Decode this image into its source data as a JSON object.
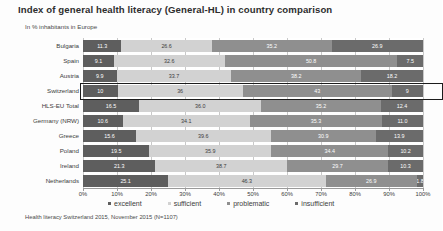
{
  "header": {
    "title": "Index of general health literacy (General-HL) in country comparison",
    "subtitle": "In % inhabitants in Europe"
  },
  "source": "Health literacy Switzerland 2015, November 2015 (N=1107)",
  "legend": [
    {
      "label": "excellent",
      "color": "#5e5e5e"
    },
    {
      "label": "sufficient",
      "color": "#d2d2d2"
    },
    {
      "label": "problematic",
      "color": "#8f8f8f"
    },
    {
      "label": "insufficient",
      "color": "#6b6b6b"
    }
  ],
  "axis": {
    "ticks": [
      "0%",
      "10%",
      "20%",
      "30%",
      "40%",
      "50%",
      "60%",
      "70%",
      "80%",
      "90%",
      "100%"
    ]
  },
  "highlight": {
    "row": "Switzerland"
  },
  "chart_data": {
    "type": "bar",
    "orientation": "horizontal",
    "stacked": true,
    "title": "Index of general health literacy (General-HL) in country comparison",
    "subtitle": "In % inhabitants in Europe",
    "xlabel": "",
    "ylabel": "",
    "xlim": [
      0,
      100
    ],
    "grid": true,
    "legend_position": "bottom",
    "categories": [
      "Bulgaria",
      "Spain",
      "Austria",
      "Switzerland",
      "HLS-EU Total",
      "Germany (NRW)",
      "Greece",
      "Poland",
      "Ireland",
      "Netherlands"
    ],
    "series": [
      {
        "name": "excellent",
        "color": "#5e5e5e",
        "values": [
          11.3,
          9.1,
          9.9,
          10,
          16.5,
          10.6,
          15.6,
          19.5,
          21.3,
          25.1
        ]
      },
      {
        "name": "sufficient",
        "color": "#d2d2d2",
        "values": [
          26.6,
          32.6,
          33.7,
          36,
          36.0,
          34.1,
          39.6,
          35.9,
          38.7,
          46.3
        ]
      },
      {
        "name": "problematic",
        "color": "#8f8f8f",
        "values": [
          35.2,
          50.8,
          38.2,
          43,
          35.2,
          35.3,
          30.9,
          34.4,
          29.7,
          26.9
        ]
      },
      {
        "name": "insufficient",
        "color": "#6b6b6b",
        "values": [
          26.9,
          7.5,
          18.2,
          9,
          12.4,
          11.0,
          13.9,
          10.2,
          10.3,
          1.8
        ]
      }
    ],
    "labels": {
      "Bulgaria": [
        "11.3",
        "26.6",
        "35.2",
        "26.9"
      ],
      "Spain": [
        "9.1",
        "32.6",
        "50.8",
        "7.5"
      ],
      "Austria": [
        "9.9",
        "33.7",
        "38.2",
        "18.2"
      ],
      "Switzerland": [
        "10",
        "36",
        "43",
        "9"
      ],
      "HLS-EU Total": [
        "16.5",
        "36.0",
        "35.2",
        "12.4"
      ],
      "Germany (NRW)": [
        "10.6",
        "34.1",
        "35.3",
        "11.0"
      ],
      "Greece": [
        "15.6",
        "39.6",
        "30.9",
        "13.9"
      ],
      "Poland": [
        "19.5",
        "35.9",
        "34.4",
        "10.2"
      ],
      "Ireland": [
        "21.3",
        "38.7",
        "29.7",
        "10.3"
      ],
      "Netherlands": [
        "25.1",
        "46.3",
        "26.9",
        "1.8"
      ]
    }
  }
}
